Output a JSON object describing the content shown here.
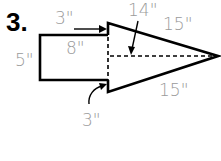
{
  "problem": {
    "number": "3."
  },
  "figure": {
    "colors": {
      "stroke": "#000000",
      "label": "#9a9a9a"
    },
    "labels": {
      "rect_width": "8\"",
      "rect_height": "5\"",
      "top_overhang": "3\"",
      "bottom_overhang": "3\"",
      "triangle_height": "14\"",
      "triangle_top_side": "15\"",
      "triangle_bottom_side": "15\""
    }
  }
}
